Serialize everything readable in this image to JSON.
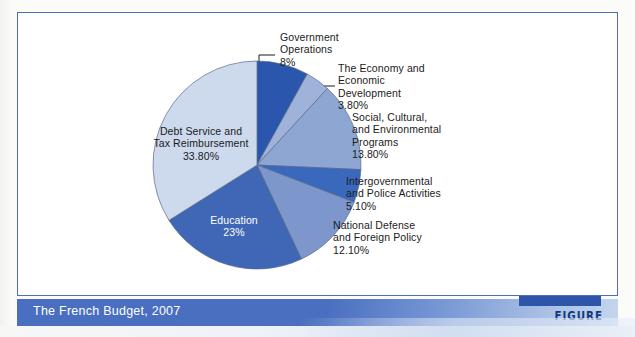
{
  "figure": {
    "caption": "The French Budget, 2007",
    "tag": "FIGURE 9.7"
  },
  "chart_data": {
    "type": "pie",
    "title": "The French Budget, 2007",
    "xlabel": "",
    "ylabel": "",
    "units": "percent of budget",
    "legend_position": "none (direct labels with leader lines)",
    "grid": false,
    "start_angle_deg": -90,
    "direction": "clockwise",
    "categories": [
      "Government Operations",
      "The Economy and Economic Development",
      "Social, Cultural, and Environmental Programs",
      "Intergovernmental and Police Activities",
      "National Defense and Foreign Policy",
      "Education",
      "Debt Service and Tax Reimbursement"
    ],
    "values": [
      8,
      3.8,
      13.8,
      5.1,
      12.1,
      23,
      33.8
    ],
    "value_labels": [
      "8%",
      "3.80%",
      "13.80%",
      "5.10%",
      "12.10%",
      "23%",
      "33.80%"
    ],
    "colors": [
      "#2a56ae",
      "#9fb2d9",
      "#8ea7d2",
      "#3a68bd",
      "#7d97cc",
      "#3f67b5",
      "#cdd9ed"
    ],
    "slices": [
      {
        "name": "Government Operations",
        "label_lines": "Government\nOperations\n8%",
        "value": 8,
        "value_label": "8%",
        "color": "#2a56ae",
        "label_placement": "outside"
      },
      {
        "name": "The Economy and Economic Development",
        "label_lines": "The Economy and\nEconomic\nDevelopment\n3.80%",
        "value": 3.8,
        "value_label": "3.80%",
        "color": "#9fb2d9",
        "label_placement": "outside"
      },
      {
        "name": "Social, Cultural, and Environmental Programs",
        "label_lines": "Social, Cultural,\nand Environmental\nPrograms\n13.80%",
        "value": 13.8,
        "value_label": "13.80%",
        "color": "#8ea7d2",
        "label_placement": "outside"
      },
      {
        "name": "Intergovernmental and Police Activities",
        "label_lines": "Intergovernmental\nand Police Activities\n5.10%",
        "value": 5.1,
        "value_label": "5.10%",
        "color": "#3a68bd",
        "label_placement": "outside"
      },
      {
        "name": "National Defense and Foreign Policy",
        "label_lines": "National Defense\nand Foreign Policy\n12.10%",
        "value": 12.1,
        "value_label": "12.10%",
        "color": "#7d97cc",
        "label_placement": "outside"
      },
      {
        "name": "Education",
        "label_lines": "Education\n23%",
        "value": 23,
        "value_label": "23%",
        "color": "#3f67b5",
        "label_placement": "inside-white-text"
      },
      {
        "name": "Debt Service and Tax Reimbursement",
        "label_lines": "Debt Service and\nTax Reimbursement\n33.80%",
        "value": 33.8,
        "value_label": "33.80%",
        "color": "#cdd9ed",
        "label_placement": "inside-dark-text"
      }
    ]
  },
  "theme": {
    "frame_border": "#4a6fc0",
    "band_blue": "#4a6fc0",
    "tag_block_blue": "#2e55a8",
    "tag_text": "#14387e",
    "canvas": "#ffffff"
  }
}
